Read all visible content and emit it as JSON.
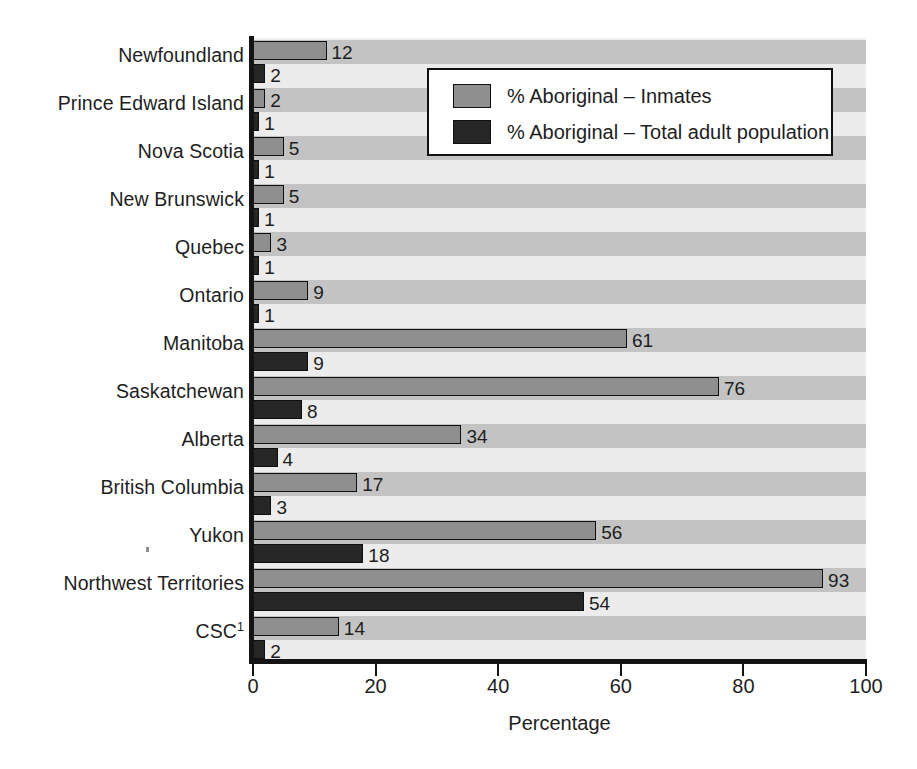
{
  "chart_data": {
    "type": "bar",
    "orientation": "horizontal",
    "title": "",
    "xlabel": "Percentage",
    "ylabel": "",
    "xlim": [
      0,
      100
    ],
    "xticks": [
      0,
      20,
      40,
      60,
      80,
      100
    ],
    "xticklabels": [
      "0",
      "20",
      "40",
      "60",
      "80",
      "100"
    ],
    "grid": false,
    "background_bands": true,
    "legend_position": "upper right (inside plot)",
    "categories": [
      "Newfoundland",
      "Prince Edward Island",
      "Nova Scotia",
      "New Brunswick",
      "Quebec",
      "Ontario",
      "Manitoba",
      "Saskatchewan",
      "Alberta",
      "British Columbia",
      "Yukon",
      "Northwest Territories",
      "CSC"
    ],
    "category_footnote_marks": {
      "CSC": "1"
    },
    "series": [
      {
        "name": "% Aboriginal – Inmates",
        "color": "#8f8f8f",
        "values": [
          12,
          2,
          5,
          5,
          3,
          9,
          61,
          76,
          34,
          17,
          56,
          93,
          14
        ]
      },
      {
        "name": "% Aboriginal – Total adult population",
        "color": "#262626",
        "values": [
          2,
          1,
          1,
          1,
          1,
          1,
          9,
          8,
          4,
          3,
          18,
          54,
          2
        ]
      }
    ]
  },
  "legend": {
    "entries": [
      {
        "label": "% Aboriginal – Inmates",
        "swatch": "inmates"
      },
      {
        "label": "% Aboriginal – Total adult population",
        "swatch": "total"
      }
    ]
  },
  "axis": {
    "x_title": "Percentage"
  },
  "colors": {
    "inmates_bar": "#8f8f8f",
    "total_bar": "#262626",
    "band_dark": "#c3c3c3",
    "band_light": "#ececec",
    "axis": "#141414",
    "text": "#1e1e1e"
  }
}
